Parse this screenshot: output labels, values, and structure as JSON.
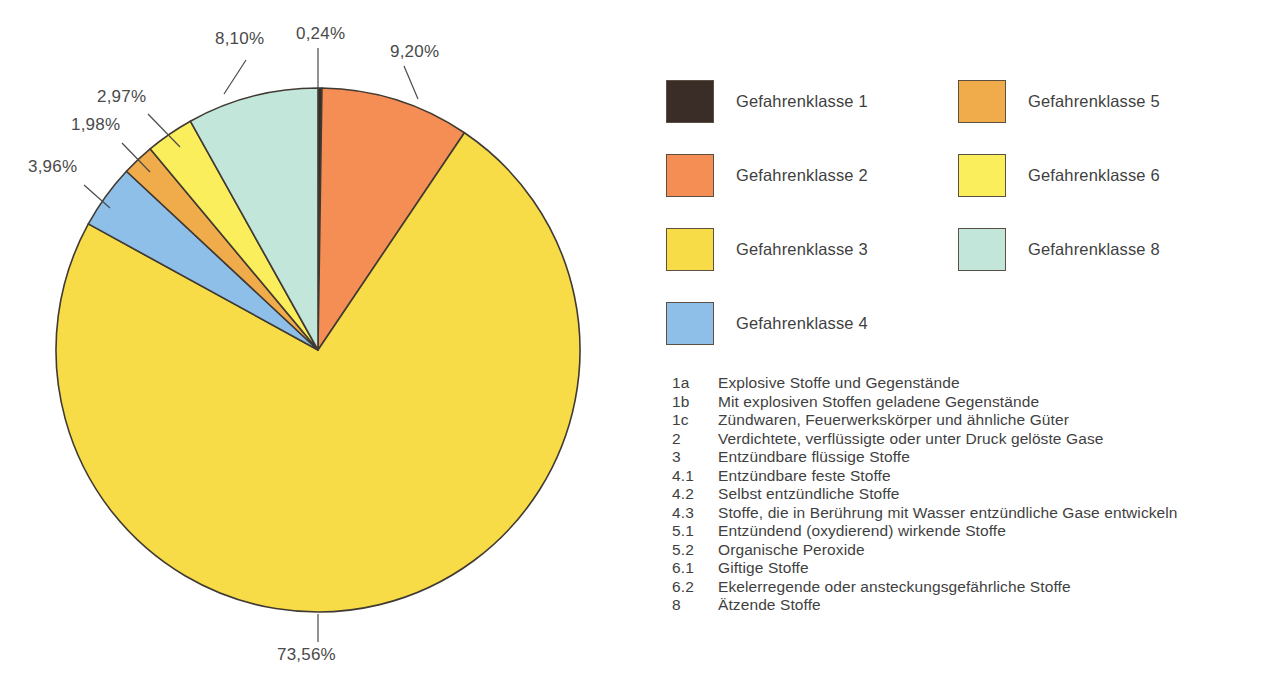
{
  "chart_data": {
    "type": "pie",
    "title": "",
    "subtitle": "",
    "xlabel": "",
    "ylabel": "",
    "legend_position": "right",
    "grid": false,
    "labels": [
      "Gefahrenklasse 1",
      "Gefahrenklasse 2",
      "Gefahrenklasse 3",
      "Gefahrenklasse 4",
      "Gefahrenklasse 5",
      "Gefahrenklasse 6",
      "Gefahrenklasse 8"
    ],
    "values": [
      0.24,
      9.2,
      73.56,
      3.96,
      1.98,
      2.97,
      8.1
    ],
    "value_labels": [
      "0,24%",
      "9,20%",
      "73,56%",
      "3,96%",
      "1,98%",
      "2,97%",
      "8,10%"
    ],
    "colors": [
      "#3a2d27",
      "#f58e54",
      "#f7dc48",
      "#8dbfe8",
      "#f0ab4b",
      "#fbee5c",
      "#c3e6db"
    ],
    "slices": [
      {
        "label": "Gefahrenklasse 1",
        "value": 0.24,
        "value_label": "0,24%",
        "color": "#3a2d27"
      },
      {
        "label": "Gefahrenklasse 2",
        "value": 9.2,
        "value_label": "9,20%",
        "color": "#f58e54"
      },
      {
        "label": "Gefahrenklasse 3",
        "value": 73.56,
        "value_label": "73,56%",
        "color": "#f7dc48"
      },
      {
        "label": "Gefahrenklasse 4",
        "value": 3.96,
        "value_label": "3,96%",
        "color": "#8dbfe8"
      },
      {
        "label": "Gefahrenklasse 5",
        "value": 1.98,
        "value_label": "1,98%",
        "color": "#f0ab4b"
      },
      {
        "label": "Gefahrenklasse 6",
        "value": 2.97,
        "value_label": "2,97%",
        "color": "#fbee5c"
      },
      {
        "label": "Gefahrenklasse 8",
        "value": 8.1,
        "value_label": "8,10%",
        "color": "#c3e6db"
      }
    ]
  },
  "pie_geometry": {
    "cx": 318,
    "cy": 350,
    "r": 262,
    "start_angle_deg": -90,
    "direction": "clockwise",
    "stroke": "#403a33",
    "stroke_width": 1.6
  },
  "callouts": [
    {
      "value_label": "0,24%",
      "text_x": 296,
      "text_y": 24,
      "line_x1": 318,
      "line_y1": 48,
      "line_x2": 318,
      "line_y2": 90
    },
    {
      "value_label": "9,20%",
      "text_x": 390,
      "text_y": 42,
      "line_x1": 404,
      "line_y1": 66,
      "line_x2": 418,
      "line_y2": 99
    },
    {
      "value_label": "8,10%",
      "text_x": 215,
      "text_y": 29,
      "line_x1": 246,
      "line_y1": 60,
      "line_x2": 224,
      "line_y2": 94
    },
    {
      "value_label": "2,97%",
      "text_x": 97,
      "text_y": 87,
      "line_x1": 148,
      "line_y1": 114,
      "line_x2": 180,
      "line_y2": 147
    },
    {
      "value_label": "1,98%",
      "text_x": 71,
      "text_y": 115,
      "line_x1": 122,
      "line_y1": 143,
      "line_x2": 150,
      "line_y2": 172
    },
    {
      "value_label": "3,96%",
      "text_x": 28,
      "text_y": 157,
      "line_x1": 84,
      "line_y1": 185,
      "line_x2": 110,
      "line_y2": 208
    },
    {
      "value_label": "73,56%",
      "text_x": 277,
      "text_y": 645,
      "line_x1": 318,
      "line_y1": 614,
      "line_x2": 318,
      "line_y2": 642
    }
  ],
  "legend": {
    "columns": [
      {
        "items": [
          {
            "label": "Gefahrenklasse 1",
            "color": "#3a2d27"
          },
          {
            "label": "Gefahrenklasse 2",
            "color": "#f58e54"
          },
          {
            "label": "Gefahrenklasse 3",
            "color": "#f7dc48"
          },
          {
            "label": "Gefahrenklasse 4",
            "color": "#8dbfe8"
          }
        ]
      },
      {
        "items": [
          {
            "label": "Gefahrenklasse 5",
            "color": "#f0ab4b"
          },
          {
            "label": "Gefahrenklasse 6",
            "color": "#fbee5c"
          },
          {
            "label": "Gefahrenklasse 8",
            "color": "#c3e6db"
          }
        ]
      }
    ]
  },
  "key_list": {
    "rows": [
      {
        "code": "1a",
        "desc": "Explosive Stoffe und Gegenstände"
      },
      {
        "code": "1b",
        "desc": "Mit explosiven Stoffen geladene Gegenstände"
      },
      {
        "code": "1c",
        "desc": "Zündwaren, Feuerwerkskörper und ähnliche Güter"
      },
      {
        "code": "2",
        "desc": "Verdichtete, verflüssigte oder unter Druck gelöste Gase"
      },
      {
        "code": "3",
        "desc": "Entzündbare flüssige Stoffe"
      },
      {
        "code": "4.1",
        "desc": "Entzündbare feste Stoffe"
      },
      {
        "code": "4.2",
        "desc": "Selbst entzündliche Stoffe"
      },
      {
        "code": "4.3",
        "desc": "Stoffe, die in Berührung mit Wasser entzündliche Gase entwickeln"
      },
      {
        "code": "5.1",
        "desc": "Entzündend (oxydierend) wirkende Stoffe"
      },
      {
        "code": "5.2",
        "desc": "Organische Peroxide"
      },
      {
        "code": "6.1",
        "desc": "Giftige Stoffe"
      },
      {
        "code": "6.2",
        "desc": "Ekelerregende oder ansteckungsgefährliche Stoffe"
      },
      {
        "code": "8",
        "desc": "Ätzende Stoffe"
      }
    ]
  }
}
